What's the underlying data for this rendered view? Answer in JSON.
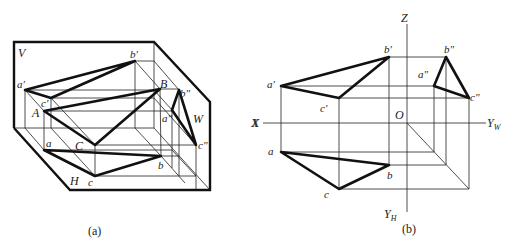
{
  "figure_a": {
    "caption": "(a)",
    "planes": {
      "V": "V",
      "H": "H",
      "W": "W"
    },
    "axis_x": "X",
    "space_points": {
      "A": "A",
      "B": "B",
      "C": "C"
    },
    "v_proj": {
      "a": "a′",
      "b": "b′",
      "c": "c′"
    },
    "h_proj": {
      "a": "a",
      "b": "b",
      "c": "c"
    },
    "w_proj": {
      "a": "a″",
      "b": "b″",
      "c": "c″"
    }
  },
  "figure_b": {
    "caption": "(b)",
    "axes": {
      "Z": "Z",
      "X": "X",
      "O": "O",
      "YW": "Y",
      "YW_sub": "W",
      "YH": "Y",
      "YH_sub": "H"
    },
    "v_proj": {
      "a": "a′",
      "b": "b′",
      "c": "c′"
    },
    "h_proj": {
      "a": "a",
      "b": "b",
      "c": "c"
    },
    "w_proj": {
      "a": "a″",
      "b": "b″",
      "c": "c″"
    }
  }
}
